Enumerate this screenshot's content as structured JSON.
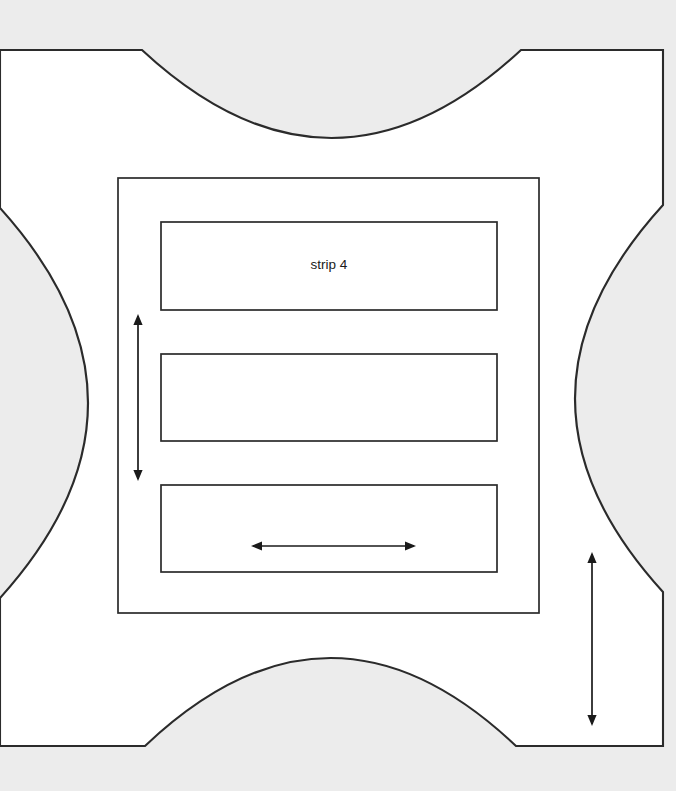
{
  "canvas": {
    "width": 676,
    "height": 791,
    "background_color": "#ececec"
  },
  "shape": {
    "name": "plus-shaped-region",
    "fill_color": "#ffffff",
    "stroke_color": "#2b2b2b",
    "description": "square white region with four concave circular arcs cut into its sides",
    "bounds": {
      "left": 0,
      "top": 50,
      "right": 663,
      "bottom": 746
    },
    "arc_anchors": {
      "top_left_x": 142,
      "top_right_x": 521,
      "right_top_y": 205,
      "right_bottom_y": 592,
      "bottom_right_x": 516,
      "bottom_left_x": 145,
      "left_bottom_y": 598,
      "left_top_y": 208
    },
    "arc_bulge": 88
  },
  "frame": {
    "label": "outer frame",
    "x": 118,
    "y": 178,
    "width": 421,
    "height": 435,
    "stroke_color": "#2b2b2b"
  },
  "strips": [
    {
      "id": "strip-1",
      "label": "strip 4",
      "x": 161,
      "y": 222,
      "width": 336,
      "height": 88
    },
    {
      "id": "strip-2",
      "label": "",
      "x": 161,
      "y": 354,
      "width": 336,
      "height": 87
    },
    {
      "id": "strip-3",
      "label": "",
      "x": 161,
      "y": 485,
      "width": 336,
      "height": 87
    }
  ],
  "dimension_arrows": [
    {
      "id": "arrow-vertical-left",
      "orientation": "vertical",
      "heads": "both",
      "x": 138,
      "y1": 314,
      "y2": 481,
      "length_px": 167,
      "label": ""
    },
    {
      "id": "arrow-horizontal-center",
      "orientation": "horizontal",
      "heads": "both",
      "y": 546,
      "x1": 251,
      "x2": 416,
      "length_px": 165,
      "label": ""
    },
    {
      "id": "arrow-vertical-right",
      "orientation": "vertical",
      "heads": "both",
      "x": 592,
      "y1": 552,
      "y2": 726,
      "length_px": 174,
      "label": ""
    }
  ],
  "colors": {
    "background": "#ececec",
    "shape_fill": "#ffffff",
    "line": "#2b2b2b",
    "arrow": "#1a1a1a",
    "text": "#1a1a1a"
  }
}
